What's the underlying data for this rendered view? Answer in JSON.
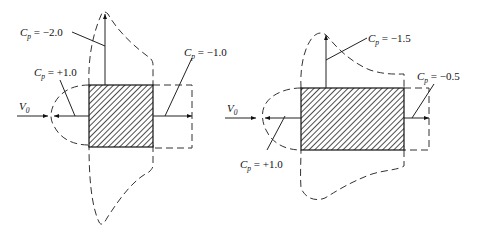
{
  "figure": {
    "title": "",
    "panels": [
      {
        "id": "left",
        "description": "Square block in flow, pressure coefficient distribution",
        "flow_label": "V",
        "flow_label_sub": "0",
        "labels": [
          {
            "id": "top",
            "symbol": "C",
            "sub": "p",
            "text": " = −2.0"
          },
          {
            "id": "front",
            "symbol": "C",
            "sub": "p",
            "text": " = +1.0"
          },
          {
            "id": "rear",
            "symbol": "C",
            "sub": "p",
            "text": " = −1.0"
          }
        ],
        "values": {
          "front": 1.0,
          "top": -2.0,
          "rear": -1.0
        }
      },
      {
        "id": "right",
        "description": "Elongated rectangular block in flow, pressure coefficient distribution",
        "flow_label": "V",
        "flow_label_sub": "0",
        "labels": [
          {
            "id": "top",
            "symbol": "C",
            "sub": "p",
            "text": " = −1.5"
          },
          {
            "id": "rear",
            "symbol": "C",
            "sub": "p",
            "text": " = −0.5"
          },
          {
            "id": "front",
            "symbol": "C",
            "sub": "p",
            "text": " = +1.0"
          }
        ],
        "values": {
          "front": 1.0,
          "top": -1.5,
          "rear": -0.5
        }
      }
    ]
  },
  "colors": {
    "ink": "#111111",
    "background": "#ffffff"
  }
}
